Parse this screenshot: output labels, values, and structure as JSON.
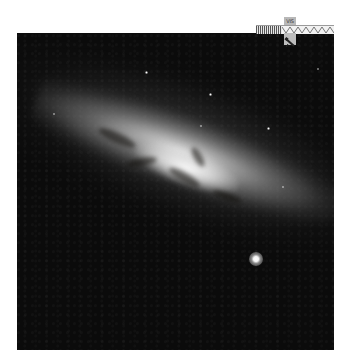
{
  "image": {
    "subject": "edge-on starburst galaxy with dark dust lanes",
    "palette": "grayscale",
    "background_color": "#0b0b0b",
    "page_background": "#ffffff"
  },
  "overlay": {
    "band_label": "VIS",
    "ruler": "spectrum-ruler",
    "icon": "telescope-icon"
  },
  "features": {
    "bright_star": {
      "x": 256,
      "y": 258
    }
  }
}
